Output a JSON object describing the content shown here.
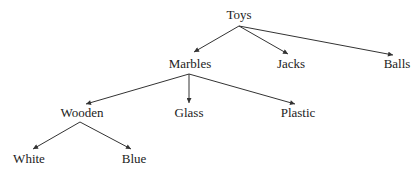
{
  "diagram": {
    "type": "tree",
    "colors": {
      "text": "#222222",
      "edge": "#333333",
      "background": "#ffffff"
    },
    "nodes": {
      "toys": {
        "label": "Toys",
        "x": 239,
        "y": 15
      },
      "marbles": {
        "label": "Marbles",
        "x": 190,
        "y": 64
      },
      "jacks": {
        "label": "Jacks",
        "x": 291,
        "y": 64
      },
      "balls": {
        "label": "Balls",
        "x": 397,
        "y": 64
      },
      "wooden": {
        "label": "Wooden",
        "x": 82,
        "y": 113
      },
      "glass": {
        "label": "Glass",
        "x": 189,
        "y": 113
      },
      "plastic": {
        "label": "Plastic",
        "x": 298,
        "y": 113
      },
      "white": {
        "label": "White",
        "x": 29,
        "y": 158
      },
      "blue": {
        "label": "Blue",
        "x": 134,
        "y": 158
      }
    },
    "edges": [
      {
        "from": "toys",
        "to": "marbles"
      },
      {
        "from": "toys",
        "to": "jacks"
      },
      {
        "from": "toys",
        "to": "balls"
      },
      {
        "from": "marbles",
        "to": "wooden"
      },
      {
        "from": "marbles",
        "to": "glass"
      },
      {
        "from": "marbles",
        "to": "plastic"
      },
      {
        "from": "wooden",
        "to": "white"
      },
      {
        "from": "wooden",
        "to": "blue"
      }
    ]
  }
}
